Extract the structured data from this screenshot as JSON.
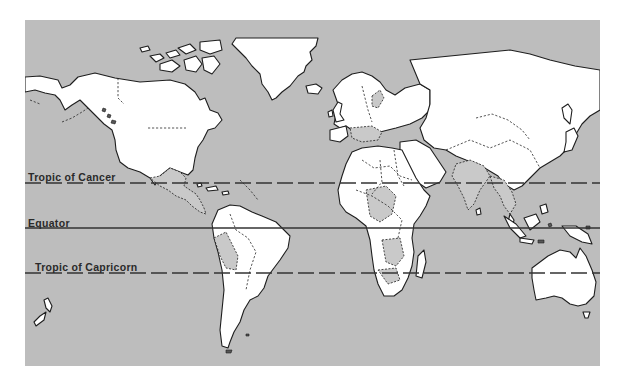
{
  "map": {
    "type": "world political outline map (Mercator)",
    "colors": {
      "ocean": "#bdbdbd",
      "land": "#ffffff",
      "land_shaded": "#c9c9c9",
      "outline": "#1e1e1e",
      "page_background": "#ffffff"
    },
    "latitude_lines": [
      {
        "label": "Tropic of Cancer",
        "style": "dashed",
        "y": 183
      },
      {
        "label": "Equator",
        "style": "solid",
        "y": 228
      },
      {
        "label": "Tropic of Capricorn",
        "style": "dashed",
        "y": 273
      }
    ]
  }
}
